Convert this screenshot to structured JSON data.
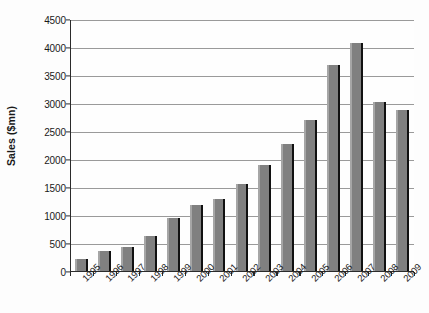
{
  "chart_data": {
    "type": "bar",
    "title": "",
    "xlabel": "",
    "ylabel": "Sales ($mn)",
    "categories": [
      "1995",
      "1996",
      "1997",
      "1998",
      "1999",
      "2000",
      "2001",
      "2002",
      "2003",
      "2004",
      "2005",
      "2006",
      "2007",
      "2008",
      "2009"
    ],
    "values": [
      220,
      350,
      420,
      630,
      950,
      1170,
      1290,
      1560,
      1900,
      2260,
      2700,
      3670,
      4080,
      3010,
      2870
    ],
    "ylim": [
      0,
      4500
    ],
    "yticks": [
      0,
      500,
      1000,
      1500,
      2000,
      2500,
      3000,
      3500,
      4000,
      4500
    ],
    "ytick_labels": [
      "0",
      "500",
      "1000",
      "1500",
      "2000",
      "2500",
      "3000",
      "3500",
      "4000",
      "4500"
    ],
    "grid": true,
    "legend": false,
    "bar_color": "#808080",
    "bar_edge_color": "#111111",
    "gridline_color": "#9a9a9a",
    "axis_color": "#2b2b2b",
    "xtick_rotation": -45
  }
}
